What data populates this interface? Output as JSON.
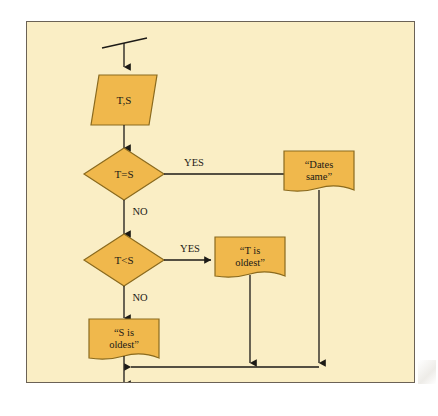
{
  "figure": {
    "kind": "flowchart",
    "background_color": "#faeec5",
    "frame_border_color": "#6b6256",
    "shape_fill_color": "#f0b84c",
    "shape_stroke_color": "#8a6a1e",
    "line_color": "#1c1a16",
    "text_color": "#1c1a16"
  },
  "nodes": {
    "start_terminator": {
      "label": "",
      "shape": "terminator-slash"
    },
    "input": {
      "label": "T,S",
      "shape": "parallelogram"
    },
    "decision_equal": {
      "label": "T=S",
      "shape": "diamond"
    },
    "decision_less": {
      "label": "T<S",
      "shape": "diamond"
    },
    "doc_dates_same": {
      "line1": "“Dates",
      "line2": "same”",
      "shape": "document"
    },
    "doc_t_oldest": {
      "line1": "“T is",
      "line2": "oldest”",
      "shape": "document"
    },
    "doc_s_oldest": {
      "line1": "“S is",
      "line2": "oldest”",
      "shape": "document"
    },
    "end_terminator": {
      "label": "",
      "shape": "terminator-slash"
    }
  },
  "edges": {
    "equal_yes": "YES",
    "equal_no": "NO",
    "less_yes": "YES",
    "less_no": "NO"
  }
}
